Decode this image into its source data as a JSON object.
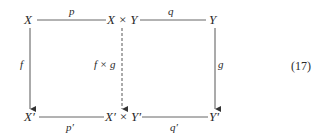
{
  "diagram": {
    "type": "commutative-diagram",
    "nodes": {
      "top_left": "X",
      "top_middle": "X × Y",
      "top_right": "Y",
      "bottom_left": "X′",
      "bottom_middle": "X′ × Y′",
      "bottom_right": "Y′"
    },
    "edges": {
      "top_left_to_middle": "p",
      "top_middle_to_right": "q",
      "bottom_left_to_middle": "p′",
      "bottom_middle_to_right": "q′",
      "left_vertical": "f",
      "middle_vertical": "f × g",
      "right_vertical": "g"
    },
    "edge_styles": {
      "left_vertical": "solid-arrow",
      "middle_vertical": "dashed-arrow",
      "right_vertical": "solid-arrow",
      "horizontals": "solid-line"
    },
    "equation_number": "(17)"
  }
}
